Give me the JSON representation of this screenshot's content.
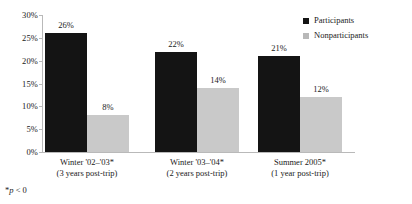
{
  "chart_data": {
    "type": "bar",
    "title": "",
    "xlabel": "",
    "ylabel": "",
    "ylim": [
      0,
      30
    ],
    "grid": false,
    "legend_position": "top-right",
    "categories": [
      "Winter '02–'03*",
      "Winter '03–'04*",
      "Summer 2005*"
    ],
    "category_sublabels": [
      "(3 years post-trip)",
      "(2 years post-trip)",
      "(1 year post-trip)"
    ],
    "series": [
      {
        "name": "Participants",
        "color": "#141414",
        "values": [
          26,
          22,
          21
        ],
        "value_labels": [
          "26%",
          "22%",
          "21%"
        ]
      },
      {
        "name": "Nonparticipants",
        "color": "#c9c9c9",
        "values": [
          8,
          14,
          12
        ],
        "value_labels": [
          "8%",
          "14%",
          "12%"
        ]
      }
    ],
    "y_ticks": [
      0,
      5,
      10,
      15,
      20,
      25,
      30
    ],
    "y_tick_labels": [
      "0%",
      "5%",
      "10%",
      "15%",
      "20%",
      "25%",
      "30%"
    ]
  },
  "legend": {
    "items": [
      {
        "label": "Participants"
      },
      {
        "label": "Nonparticipants"
      }
    ]
  },
  "footnote": {
    "marker": "*",
    "statistic": "p",
    "comparison": " < 0"
  }
}
